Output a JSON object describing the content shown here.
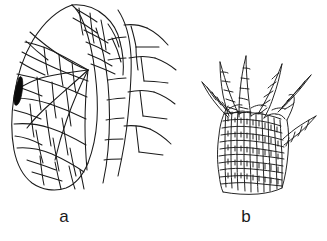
{
  "figure": {
    "background_color": "#ffffff",
    "ink_color": "#1a1a1a",
    "width_px": 327,
    "height_px": 241,
    "style": "scientific line drawing, black ink on white"
  },
  "panels": [
    {
      "id": "a",
      "caption": "a",
      "subject": "leaf-like blade with cellular areolation and marginal veins",
      "features": {
        "dark_marking": "solid black elongate cell on left margin",
        "cell_network": "irregular polygonal cells",
        "marginal_branches": "four branching lateral veins on right side"
      }
    },
    {
      "id": "b",
      "caption": "b",
      "subject": "spinose cellular organ with projecting spines",
      "features": {
        "spine_count": "six cellular spines",
        "cell_network": "dense small quadrate cells",
        "outline": "broadly fan-shaped base"
      }
    }
  ],
  "captions": {
    "a": "a",
    "b": "b"
  }
}
